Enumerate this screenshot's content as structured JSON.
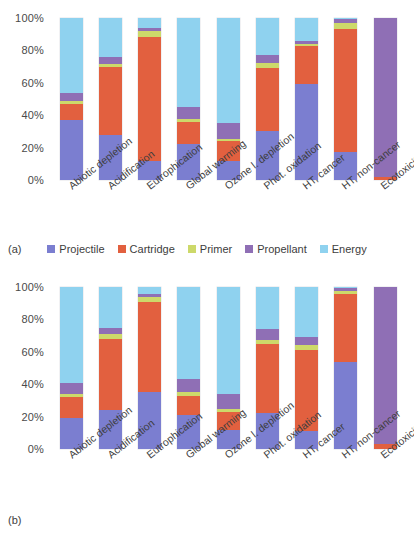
{
  "figure": {
    "panel_a_tag": "(a)",
    "panel_b_tag": "(b)"
  },
  "legend": {
    "position": "below-panel-a",
    "items": [
      {
        "label": "Projectile",
        "color": "#7b7ed0"
      },
      {
        "label": "Cartridge",
        "color": "#e2603f"
      },
      {
        "label": "Primer",
        "color": "#cdd96a"
      },
      {
        "label": "Propellant",
        "color": "#8f6fb5"
      },
      {
        "label": "Energy",
        "color": "#8fd2ef"
      }
    ]
  },
  "axis": {
    "yticks": [
      "0%",
      "20%",
      "40%",
      "60%",
      "80%",
      "100%"
    ],
    "ytick_values": [
      0,
      20,
      40,
      60,
      80,
      100
    ],
    "ylim": [
      0,
      100
    ]
  },
  "categories": [
    "Abiotic depletion",
    "Acidification",
    "Eutrophication",
    "Global warming",
    "Ozone l. depletion",
    "Phot. oxidation",
    "HT, cancer",
    "HT, non-cancer",
    "Ecotoxicity"
  ],
  "chart_data": [
    {
      "type": "bar",
      "stacked": true,
      "normalized": true,
      "panel": "(a)",
      "title": "",
      "xlabel": "",
      "ylabel": "",
      "ylim": [
        0,
        100
      ],
      "grid": false,
      "legend_position": "bottom",
      "categories": [
        "Abiotic depletion",
        "Acidification",
        "Eutrophication",
        "Global warming",
        "Ozone l. depletion",
        "Phot. oxidation",
        "HT, cancer",
        "HT, non-cancer",
        "Ecotoxicity"
      ],
      "series": [
        {
          "name": "Projectile",
          "color": "#7b7ed0",
          "values": [
            37,
            28,
            12,
            22,
            12,
            30,
            59,
            17,
            0
          ]
        },
        {
          "name": "Cartridge",
          "color": "#e2603f",
          "values": [
            10,
            42,
            76,
            14,
            12,
            39,
            24,
            76,
            2
          ]
        },
        {
          "name": "Primer",
          "color": "#cdd96a",
          "values": [
            1.5,
            1.5,
            4,
            1.5,
            1.5,
            3,
            1,
            4,
            0
          ]
        },
        {
          "name": "Propellant",
          "color": "#8f6fb5",
          "values": [
            5.5,
            4.5,
            2,
            7.5,
            9.5,
            5,
            2,
            2.5,
            98
          ]
        },
        {
          "name": "Energy",
          "color": "#8fd2ef",
          "values": [
            46,
            24,
            6,
            55,
            65,
            23,
            14,
            0.5,
            0
          ]
        }
      ]
    },
    {
      "type": "bar",
      "stacked": true,
      "normalized": true,
      "panel": "(b)",
      "title": "",
      "xlabel": "",
      "ylabel": "",
      "ylim": [
        0,
        100
      ],
      "grid": false,
      "legend_position": "none",
      "categories": [
        "Abiotic depletion",
        "Acidification",
        "Eutrophication",
        "Global warming",
        "Ozone l. depletion",
        "Phot. oxidation",
        "HT, cancer",
        "HT, non-cancer",
        "Ecotoxicity"
      ],
      "series": [
        {
          "name": "Projectile",
          "color": "#7b7ed0",
          "values": [
            19,
            24,
            35,
            21,
            12,
            22,
            11,
            54,
            0
          ]
        },
        {
          "name": "Cartridge",
          "color": "#e2603f",
          "values": [
            13,
            44,
            56,
            12,
            11,
            43,
            50,
            42,
            3
          ]
        },
        {
          "name": "Primer",
          "color": "#cdd96a",
          "values": [
            2,
            3,
            3,
            2,
            2,
            2,
            3,
            1.5,
            0
          ]
        },
        {
          "name": "Propellant",
          "color": "#8f6fb5",
          "values": [
            7,
            4,
            1.5,
            8,
            9,
            7,
            5,
            2,
            97
          ]
        },
        {
          "name": "Energy",
          "color": "#8fd2ef",
          "values": [
            59,
            25,
            4.5,
            57,
            66,
            26,
            31,
            0.5,
            0
          ]
        }
      ]
    }
  ]
}
